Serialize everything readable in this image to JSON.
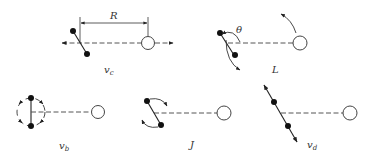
{
  "diagram": {
    "panels": [
      {
        "id": "vc",
        "label": "v",
        "subscript": "c",
        "description": "translation along line of sight"
      },
      {
        "id": "L",
        "label": "L",
        "description": "rotation/libration with angle theta"
      },
      {
        "id": "vb",
        "label": "v",
        "subscript": "b",
        "description": "rotation in plane (circular)"
      },
      {
        "id": "J",
        "label": "J",
        "description": "spin about center"
      },
      {
        "id": "vd",
        "label": "v",
        "subscript": "d",
        "description": "translation along rod axis"
      }
    ],
    "annotations": {
      "distance": "R",
      "angle": "θ"
    },
    "colors": {
      "ink": "#222222",
      "dash": "#555555",
      "background": "#ffffff"
    }
  }
}
